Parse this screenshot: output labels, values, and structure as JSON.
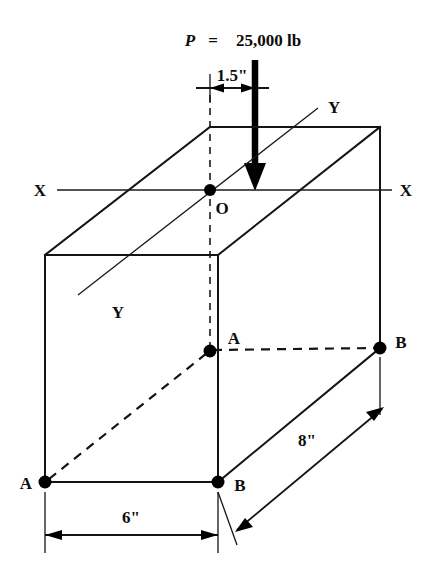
{
  "figure": {
    "type": "engineering-diagram",
    "title": {
      "symbol": "P",
      "equals": "=",
      "value": "25,000 lb"
    },
    "dimensions": [
      {
        "id": "eccentricity",
        "label": "1.5\""
      },
      {
        "id": "width",
        "label": "6\""
      },
      {
        "id": "depth",
        "label": "8\""
      }
    ],
    "axes": [
      {
        "id": "x-left",
        "label": "X"
      },
      {
        "id": "x-right",
        "label": "X"
      },
      {
        "id": "y-upper",
        "label": "Y"
      },
      {
        "id": "y-lower",
        "label": "Y"
      }
    ],
    "points": [
      {
        "id": "origin",
        "label": "O"
      },
      {
        "id": "a-mid",
        "label": "A"
      },
      {
        "id": "b-mid",
        "label": "B"
      },
      {
        "id": "a-bottom",
        "label": "A"
      },
      {
        "id": "b-bottom",
        "label": "B"
      }
    ],
    "colors": {
      "ink": "#141414",
      "background": "#ffffff"
    }
  }
}
